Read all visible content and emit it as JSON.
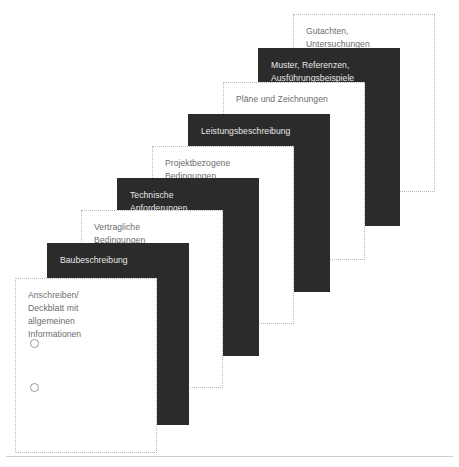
{
  "figure": {
    "name": "Struktur der Vergabeunterlagen",
    "type": "stacked-document-sheets",
    "sheet_count": 9,
    "colors": {
      "sheet_dark_fill": "#2b2b2b",
      "sheet_light_fill": "#ffffff",
      "sheet_light_border": "#b9b9b9",
      "label_on_dark": "#e8e8e8",
      "label_on_light": "#6d6d6d",
      "baseline_rule": "#cfcfcf"
    },
    "baseline_rule_visible": true
  },
  "sheets": [
    {
      "index": 1,
      "label": "Anschreiben/\nDeckblatt mit\nallgemeinen\nInformationen",
      "style": "light",
      "x": 15,
      "y": 278,
      "has_punch_holes": true,
      "has_folded_corner": true
    },
    {
      "index": 2,
      "label": "Baubeschreibung",
      "style": "dark",
      "x": 48,
      "y": 243,
      "has_punch_holes": false,
      "has_folded_corner": false
    },
    {
      "index": 3,
      "label": "Vertragliche\nBedingungen",
      "style": "light",
      "x": 81,
      "y": 208,
      "has_punch_holes": false,
      "has_folded_corner": false
    },
    {
      "index": 4,
      "label": "Technische\nAnforderungen",
      "style": "dark",
      "x": 114,
      "y": 173,
      "has_punch_holes": false,
      "has_folded_corner": false
    },
    {
      "index": 5,
      "label": "Projektbezogene\nBedingungen",
      "style": "light",
      "x": 147,
      "y": 138,
      "has_punch_holes": false,
      "has_folded_corner": false
    },
    {
      "index": 6,
      "label": "Leistungsbeschreibung",
      "style": "dark",
      "x": 180,
      "y": 103,
      "has_punch_holes": false,
      "has_folded_corner": false
    },
    {
      "index": 7,
      "label": "Pläne und Zeichnungen",
      "style": "light",
      "x": 213,
      "y": 68,
      "has_punch_holes": false,
      "has_folded_corner": false
    },
    {
      "index": 8,
      "label": "Muster, Referenzen,\nAusführungsbeispiele",
      "style": "dark",
      "x": 246,
      "y": 33,
      "has_punch_holes": false,
      "has_folded_corner": false
    },
    {
      "index": 9,
      "label": "Gutachten,\nUntersuchungen",
      "style": "light",
      "x": 293,
      "y": 14,
      "has_punch_holes": false,
      "has_folded_corner": false
    }
  ]
}
